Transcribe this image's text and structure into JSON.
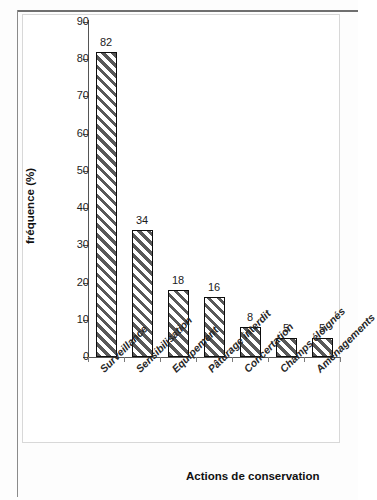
{
  "chart_data": {
    "type": "bar",
    "title": "",
    "subtitle": "",
    "xlabel": "Actions de conservation",
    "ylabel": "fréquence (%)",
    "categories": [
      "Surveillance",
      "Sensibilisation",
      "Equipement",
      "Pâturage interdit",
      "Concertation",
      "Champs éloignés",
      "Aménagements"
    ],
    "values": [
      82,
      34,
      18,
      16,
      8,
      5,
      5
    ],
    "data_labels": [
      "82",
      "34",
      "18",
      "16",
      "8",
      "5",
      "5"
    ],
    "ylim": [
      0,
      90
    ],
    "ytick_values": [
      0,
      10,
      20,
      30,
      40,
      50,
      60,
      70,
      80,
      90
    ],
    "ytick_labels": [
      "0",
      "10",
      "20",
      "30",
      "40",
      "50",
      "60",
      "70",
      "80",
      "90"
    ],
    "ytick_step": 10,
    "grid": false,
    "legend": false,
    "legend_position": "none",
    "series": [
      {
        "name": "fréquence (%)",
        "values": [
          82,
          34,
          18,
          16,
          8,
          5,
          5
        ],
        "fill": "diagonal-hatch",
        "hatch_color": "#585858",
        "bar_color": "#ffffff",
        "edge_color": "#0d0d0d"
      }
    ]
  },
  "figure": {
    "background": "#ffffff",
    "frame_color": "#8b8b8b",
    "axis_color": "#555555",
    "text_color": "#1d1d1d"
  }
}
